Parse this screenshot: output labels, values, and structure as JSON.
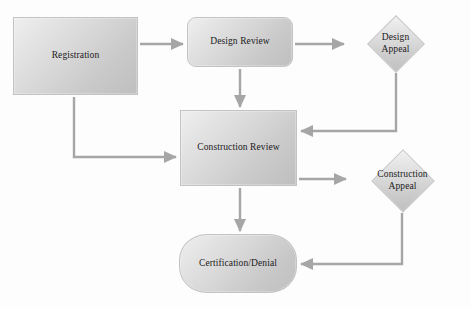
{
  "diagram": {
    "background_color": "#fdfdfd",
    "node_fill_light": "#efefef",
    "node_fill_dark": "#bfbfbf",
    "node_border_color": "#c3c3c3",
    "edge_color": "#a6a6a6",
    "text_color": "#1a1a1a",
    "nodes": [
      {
        "id": "registration",
        "label": "Registration",
        "shape": "rectangle",
        "x": 13,
        "y": 17,
        "w": 125,
        "h": 78
      },
      {
        "id": "design-review",
        "label": "Design Review",
        "shape": "rounded-rectangle",
        "x": 187,
        "y": 17,
        "w": 106,
        "h": 50
      },
      {
        "id": "design-appeal",
        "label": "Design\nAppeal",
        "shape": "diamond",
        "x": 347,
        "y": 16,
        "w": 97,
        "h": 55
      },
      {
        "id": "construction-review",
        "label": "Construction Review",
        "shape": "rectangle",
        "x": 180,
        "y": 110,
        "w": 117,
        "h": 76
      },
      {
        "id": "construction-appeal",
        "label": "Construction\nAppeal",
        "shape": "diamond",
        "x": 349,
        "y": 150,
        "w": 107,
        "h": 61
      },
      {
        "id": "certification-denial",
        "label": "Certification/Denial",
        "shape": "pill",
        "x": 179,
        "y": 234,
        "w": 118,
        "h": 59
      }
    ],
    "edges": [
      {
        "id": "registration-to-design-review",
        "from": "registration",
        "to": "design-review",
        "style": "straight-arrow",
        "direction": "right"
      },
      {
        "id": "design-review-to-design-appeal",
        "from": "design-review",
        "to": "design-appeal",
        "style": "straight-arrow",
        "direction": "right"
      },
      {
        "id": "design-review-to-construction-review",
        "from": "design-review",
        "to": "construction-review",
        "style": "straight-arrow",
        "direction": "down"
      },
      {
        "id": "registration-to-construction-review",
        "from": "registration",
        "to": "construction-review",
        "style": "elbow-arrow",
        "direction": "down-then-right"
      },
      {
        "id": "design-appeal-to-construction-review",
        "from": "design-appeal",
        "to": "construction-review",
        "style": "elbow-arrow",
        "direction": "down-then-left"
      },
      {
        "id": "construction-review-to-construction-appeal",
        "from": "construction-review",
        "to": "construction-appeal",
        "style": "straight-arrow",
        "direction": "right"
      },
      {
        "id": "construction-review-to-certification-denial",
        "from": "construction-review",
        "to": "certification-denial",
        "style": "straight-arrow",
        "direction": "down"
      },
      {
        "id": "construction-appeal-to-certification-denial",
        "from": "construction-appeal",
        "to": "certification-denial",
        "style": "elbow-arrow",
        "direction": "down-then-left"
      }
    ]
  }
}
